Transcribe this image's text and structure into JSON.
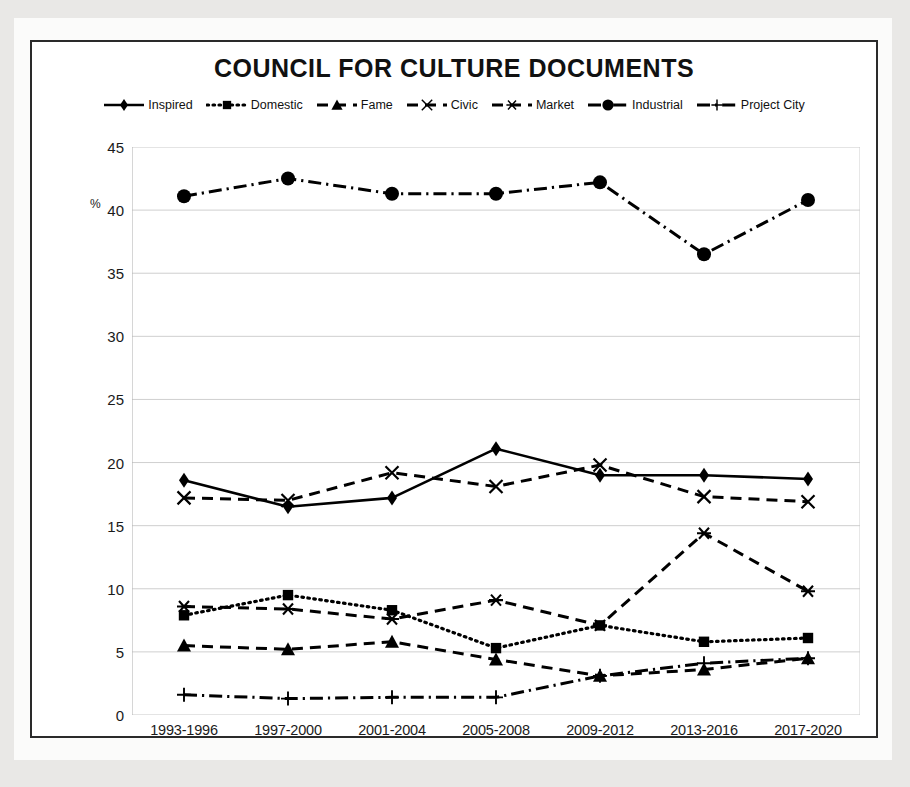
{
  "chart_title": "COUNCIL FOR CULTURE DOCUMENTS",
  "y_axis_unit": "%",
  "legend": [
    {
      "label": "Inspired",
      "key": "solid-line-diamond-marker"
    },
    {
      "label": "Domestic",
      "key": "dotted-line-square-marker"
    },
    {
      "label": "Fame",
      "key": "dashed-line-triangle-marker"
    },
    {
      "label": "Civic",
      "key": "dashed-line-x-marker"
    },
    {
      "label": "Market",
      "key": "dashed-line-asterisk-marker"
    },
    {
      "label": "Industrial",
      "key": "dashdot-line-circle-marker"
    },
    {
      "label": "Project City",
      "key": "dashdot-line-plus-marker"
    }
  ],
  "y_ticks": [
    "45",
    "40",
    "35",
    "30",
    "25",
    "20",
    "15",
    "10",
    "5",
    "0"
  ],
  "x_ticks": [
    "1993-1996",
    "1997-2000",
    "2001-2004",
    "2005-2008",
    "2009-2012",
    "2013-2016",
    "2017-2020"
  ],
  "chart_data": {
    "type": "line",
    "title": "COUNCIL FOR CULTURE DOCUMENTS",
    "xlabel": "",
    "ylabel": "%",
    "ylim": [
      0,
      45
    ],
    "ytick_step": 5,
    "grid": true,
    "legend_position": "top-center",
    "categories": [
      "1993-1996",
      "1997-2000",
      "2001-2004",
      "2005-2008",
      "2009-2012",
      "2013-2016",
      "2017-2020"
    ],
    "series": [
      {
        "name": "Inspired",
        "marker": "diamond",
        "linestyle": "solid",
        "color": "#000000",
        "values": [
          18.6,
          16.5,
          17.2,
          21.1,
          19.0,
          19.0,
          18.7
        ]
      },
      {
        "name": "Domestic",
        "marker": "square",
        "linestyle": "dotted",
        "color": "#000000",
        "values": [
          7.9,
          9.5,
          8.3,
          5.3,
          7.1,
          5.8,
          6.1
        ]
      },
      {
        "name": "Fame",
        "marker": "triangle",
        "linestyle": "dashed",
        "color": "#000000",
        "values": [
          5.5,
          5.2,
          5.8,
          4.4,
          3.1,
          3.6,
          4.5
        ]
      },
      {
        "name": "Civic",
        "marker": "x",
        "linestyle": "dashed",
        "color": "#000000",
        "values": [
          17.2,
          17.0,
          19.2,
          18.1,
          19.8,
          17.3,
          16.9
        ]
      },
      {
        "name": "Market",
        "marker": "asterisk",
        "linestyle": "dashed",
        "color": "#000000",
        "values": [
          8.6,
          8.4,
          7.6,
          9.1,
          7.1,
          14.4,
          9.8
        ]
      },
      {
        "name": "Industrial",
        "marker": "circle",
        "linestyle": "dashdot",
        "color": "#000000",
        "values": [
          41.1,
          42.5,
          41.3,
          41.3,
          42.2,
          36.5,
          40.8
        ]
      },
      {
        "name": "Project City",
        "marker": "plus",
        "linestyle": "dashdot",
        "color": "#000000",
        "values": [
          1.6,
          1.3,
          1.4,
          1.4,
          3.1,
          4.1,
          4.5
        ]
      }
    ]
  }
}
